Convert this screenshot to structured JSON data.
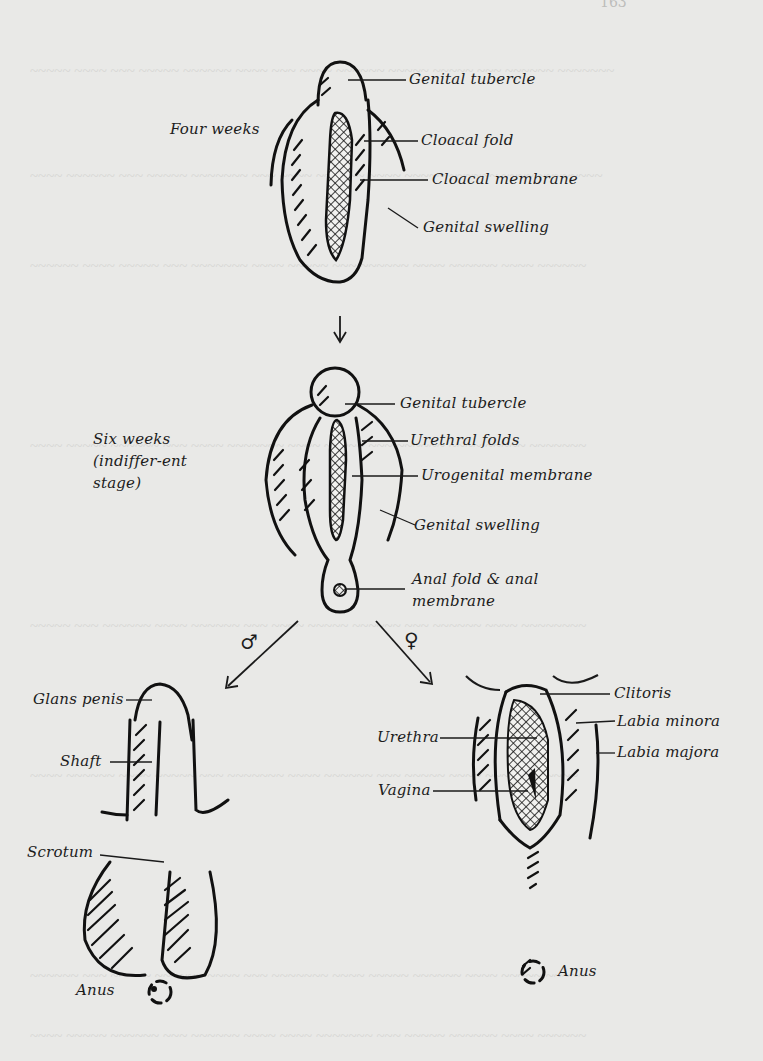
{
  "page": {
    "page_number": "163",
    "background": "#e9e9e7",
    "ink": "#1a1a1a"
  },
  "stages": {
    "four_weeks": {
      "title": "Four weeks",
      "labels": [
        "Genital tubercle",
        "Cloacal fold",
        "Cloacal membrane",
        "Genital swelling"
      ]
    },
    "six_weeks": {
      "title": "Six weeks (indiffer-ent stage)",
      "labels": [
        "Genital tubercle",
        "Urethral folds",
        "Urogenital membrane",
        "Genital swelling",
        "Anal fold & anal membrane"
      ]
    },
    "male": {
      "symbol": "♂",
      "labels": [
        "Glans penis",
        "Shaft",
        "Scrotum",
        "Anus"
      ]
    },
    "female": {
      "symbol": "♀",
      "labels": [
        "Clitoris",
        "Labia minora",
        "Urethra",
        "Labia majora",
        "Vagina",
        "Anus"
      ]
    }
  }
}
